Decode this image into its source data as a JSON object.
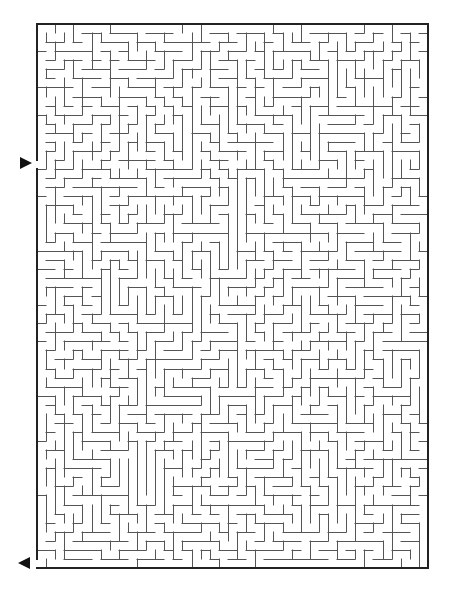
{
  "maze": {
    "frame": {
      "x": 37,
      "y": 24,
      "width": 391,
      "height": 544
    },
    "cols": 43,
    "rows": 60,
    "seed": 20240611,
    "wall_color": "#555555",
    "border_color": "#222222",
    "wall_width": 1,
    "border_width": 2,
    "entrance": {
      "side": "left",
      "row": 15,
      "arrow_direction": "right",
      "arrow_x": 20,
      "arrow_y": 163
    },
    "exit": {
      "side": "left",
      "row": 59,
      "arrow_direction": "left",
      "arrow_x": 18,
      "arrow_y": 563
    }
  }
}
